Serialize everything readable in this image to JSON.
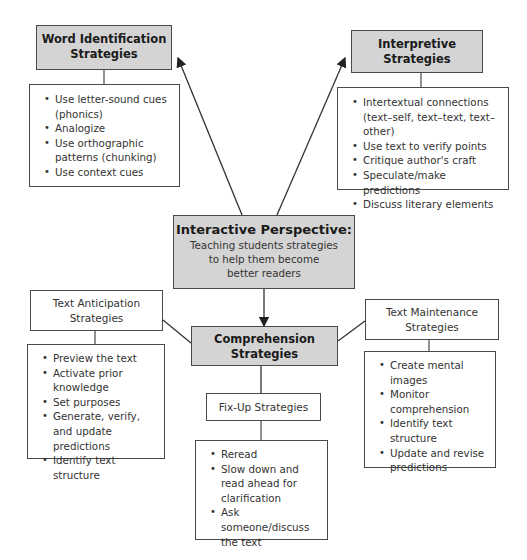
{
  "diagram": {
    "center": {
      "title": "Interactive Perspective:",
      "subtitle_lines": [
        "Teaching students strategies",
        "to help them become",
        "better readers"
      ]
    },
    "word_identification": {
      "title_lines": [
        "Word Identification",
        "Strategies"
      ],
      "items": [
        "Use letter-sound cues (phonics)",
        "Analogize",
        "Use orthographic patterns (chunking)",
        "Use context cues"
      ]
    },
    "interpretive": {
      "title_lines": [
        "Interpretive",
        "Strategies"
      ],
      "items": [
        "Intertextual connections (text–self, text–text, text–other)",
        "Use text to verify points",
        "Critique author's craft",
        "Speculate/make predictions",
        "Discuss literary elements"
      ]
    },
    "comprehension": {
      "title_lines": [
        "Comprehension",
        "Strategies"
      ]
    },
    "text_anticipation": {
      "title_lines": [
        "Text Anticipation",
        "Strategies"
      ],
      "items": [
        "Preview the text",
        "Activate prior knowledge",
        "Set purposes",
        "Generate, verify, and update predictions",
        "Identify text structure"
      ]
    },
    "text_maintenance": {
      "title_lines": [
        "Text Maintenance",
        "Strategies"
      ],
      "items": [
        "Create mental images",
        "Monitor comprehension",
        "Identify text structure",
        "Update and revise predictions"
      ]
    },
    "fix_up": {
      "title": "Fix-Up Strategies",
      "items": [
        "Reread",
        "Slow down and read ahead for clarification",
        "Ask someone/discuss the text"
      ]
    },
    "colors": {
      "gray_fill": "#d4d4d4",
      "border": "#4a4a4a"
    }
  }
}
